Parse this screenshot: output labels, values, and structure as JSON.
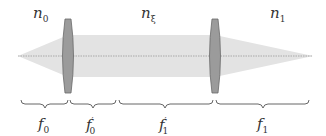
{
  "diagram": {
    "type": "two-lens optical system",
    "colors": {
      "beam": "#e2e2e2",
      "lens_fill": "#9a9a9a",
      "lens_stroke": "#666666",
      "axis": "#888888",
      "text": "#333333"
    },
    "media": [
      {
        "symbol": "n",
        "sub": "0",
        "label": "n0"
      },
      {
        "symbol": "n",
        "sub": "ξ",
        "label": "nξ"
      },
      {
        "symbol": "n",
        "sub": "1",
        "label": "n1"
      }
    ],
    "focal_lengths": [
      {
        "symbol": "f",
        "sub": "0",
        "prime": "",
        "label": "f0"
      },
      {
        "symbol": "f",
        "sub": "0",
        "prime": "′",
        "label": "f0′"
      },
      {
        "symbol": "f",
        "sub": "1",
        "prime": "′",
        "label": "f1′"
      },
      {
        "symbol": "f",
        "sub": "1",
        "prime": "",
        "label": "f1"
      }
    ],
    "lenses": [
      {
        "name": "lens-0"
      },
      {
        "name": "lens-1"
      }
    ]
  }
}
